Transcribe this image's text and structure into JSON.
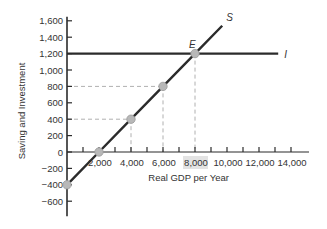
{
  "chart_data": {
    "type": "line",
    "title": "",
    "xlabel": "Real GDP per Year",
    "ylabel": "Saving and Investment",
    "xlim": [
      0,
      15000
    ],
    "ylim": [
      -600,
      1600
    ],
    "x_ticks": [
      "2,000",
      "4,000",
      "6,000",
      "8,000",
      "10,000",
      "12,000",
      "14,000"
    ],
    "y_ticks": [
      "1,600",
      "1,400",
      "1,200",
      "1,000",
      "800",
      "600",
      "400",
      "200",
      "0",
      "−200",
      "−400",
      "−600"
    ],
    "highlighted_x_tick": "8,000",
    "grid": false,
    "series": [
      {
        "name": "S",
        "label": "S",
        "kind": "saving",
        "x": [
          0,
          2000,
          4000,
          6000,
          8000,
          9700
        ],
        "y": [
          -400,
          0,
          400,
          800,
          1200,
          1540
        ],
        "markers": [
          [
            0,
            -400
          ],
          [
            2000,
            0
          ],
          [
            4000,
            400
          ],
          [
            6000,
            800
          ],
          [
            8000,
            1200
          ]
        ]
      },
      {
        "name": "I",
        "label": "I",
        "kind": "investment",
        "x": [
          0,
          13200
        ],
        "y": [
          1200,
          1200
        ]
      }
    ],
    "annotations": [
      {
        "text": "E",
        "x": 8000,
        "y": 1200,
        "note": "equilibrium point"
      }
    ],
    "reference_lines": {
      "horizontal_dashed": [
        400,
        800
      ],
      "vertical_dashed": [
        4000,
        6000,
        8000
      ]
    },
    "colors": {
      "line": "#2b2b2b",
      "marker": "#b8b8b8",
      "dashed": "#b0b0b0",
      "highlight": "#e3e3e3"
    }
  }
}
